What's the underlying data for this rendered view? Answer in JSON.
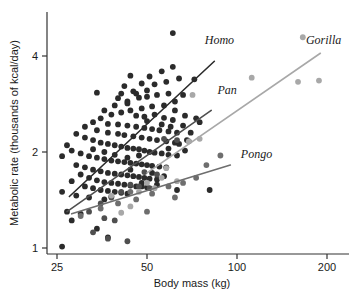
{
  "chart_data": {
    "type": "scatter",
    "title": "",
    "xlabel": "Body mass (kg)",
    "ylabel": "Metabolic rate (thousands of kcal/day)",
    "xscale": "log",
    "yscale": "log",
    "xlim": [
      23,
      215
    ],
    "ylim": [
      0.95,
      5.0
    ],
    "xticks": [
      25,
      50,
      100,
      200
    ],
    "xticklabels": [
      "25",
      "50",
      "100",
      "200"
    ],
    "yticks": [
      1,
      2,
      4
    ],
    "yticklabels": [
      "1",
      "2",
      "4"
    ],
    "grid": false,
    "legend": "none",
    "annotations": [
      {
        "text": "Homo",
        "x": 78,
        "y": 4.35
      },
      {
        "text": "Pan",
        "x": 86,
        "y": 3.05
      },
      {
        "text": "Pongo",
        "x": 103,
        "y": 1.92
      },
      {
        "text": "Gorilla",
        "x": 170,
        "y": 4.35
      }
    ],
    "colors": {
      "homo": "#2b2b2b",
      "pan": "#4f4f4f",
      "pongo": "#6e6e6e",
      "gorilla": "#a8a8a8",
      "axis": "#333333",
      "text": "#1a1a1a"
    },
    "series": [
      {
        "name": "Homo",
        "color": "#2b2b2b",
        "fit_line": {
          "x": [
            27.5,
            84
          ],
          "y": [
            1.45,
            3.85
          ]
        },
        "points": [
          [
            61,
            4.72
          ],
          [
            34,
            3.07
          ],
          [
            44,
            3.47
          ],
          [
            48,
            3.28
          ],
          [
            51,
            3.45
          ],
          [
            56,
            3.58
          ],
          [
            61,
            3.7
          ],
          [
            42,
            3.22
          ],
          [
            46,
            3.05
          ],
          [
            50,
            3.12
          ],
          [
            53,
            3.26
          ],
          [
            58,
            3.32
          ],
          [
            64,
            3.4
          ],
          [
            40,
            2.95
          ],
          [
            43,
            2.88
          ],
          [
            47,
            2.96
          ],
          [
            50,
            2.98
          ],
          [
            54,
            3.02
          ],
          [
            59,
            3.05
          ],
          [
            66,
            3.02
          ],
          [
            72,
            3.38
          ],
          [
            62,
            2.88
          ],
          [
            57,
            2.8
          ],
          [
            52,
            2.78
          ],
          [
            48,
            2.74
          ],
          [
            44,
            2.7
          ],
          [
            41,
            2.66
          ],
          [
            38,
            2.62
          ],
          [
            36,
            2.7
          ],
          [
            39,
            2.8
          ],
          [
            43,
            2.84
          ],
          [
            46,
            2.6
          ],
          [
            49,
            2.58
          ],
          [
            53,
            2.62
          ],
          [
            57,
            2.56
          ],
          [
            61,
            2.52
          ],
          [
            67,
            2.6
          ],
          [
            73,
            2.55
          ],
          [
            35,
            2.55
          ],
          [
            33,
            2.48
          ],
          [
            37,
            2.45
          ],
          [
            40,
            2.44
          ],
          [
            43,
            2.42
          ],
          [
            46,
            2.4
          ],
          [
            49,
            2.38
          ],
          [
            52,
            2.36
          ],
          [
            55,
            2.34
          ],
          [
            59,
            2.32
          ],
          [
            63,
            2.3
          ],
          [
            31,
            2.4
          ],
          [
            34,
            2.34
          ],
          [
            37,
            2.3
          ],
          [
            40,
            2.28
          ],
          [
            42,
            2.26
          ],
          [
            45,
            2.24
          ],
          [
            48,
            2.22
          ],
          [
            51,
            2.2
          ],
          [
            54,
            2.18
          ],
          [
            58,
            2.16
          ],
          [
            62,
            2.14
          ],
          [
            68,
            2.18
          ],
          [
            29,
            2.28
          ],
          [
            31,
            2.22
          ],
          [
            33,
            2.18
          ],
          [
            35,
            2.14
          ],
          [
            37,
            2.12
          ],
          [
            39,
            2.1
          ],
          [
            41,
            2.08
          ],
          [
            43,
            2.06
          ],
          [
            45,
            2.05
          ],
          [
            47,
            2.04
          ],
          [
            49,
            2.02
          ],
          [
            51,
            2.0
          ],
          [
            53,
            1.99
          ],
          [
            56,
            1.98
          ],
          [
            59,
            1.96
          ],
          [
            63,
            1.95
          ],
          [
            67,
            2.02
          ],
          [
            27,
            2.1
          ],
          [
            28,
            2.02
          ],
          [
            30,
            1.98
          ],
          [
            32,
            1.94
          ],
          [
            34,
            1.92
          ],
          [
            36,
            1.9
          ],
          [
            38,
            1.88
          ],
          [
            40,
            1.87
          ],
          [
            42,
            1.86
          ],
          [
            44,
            1.85
          ],
          [
            46,
            1.84
          ],
          [
            48,
            1.83
          ],
          [
            50,
            1.82
          ],
          [
            52,
            1.81
          ],
          [
            55,
            1.8
          ],
          [
            58,
            1.79
          ],
          [
            26,
            1.94
          ],
          [
            29,
            1.82
          ],
          [
            31,
            1.79
          ],
          [
            33,
            1.76
          ],
          [
            35,
            1.74
          ],
          [
            37,
            1.72
          ],
          [
            39,
            1.71
          ],
          [
            41,
            1.7
          ],
          [
            43,
            1.69
          ],
          [
            45,
            1.68
          ],
          [
            47,
            1.67
          ],
          [
            49,
            1.66
          ],
          [
            51,
            1.65
          ],
          [
            54,
            1.64
          ],
          [
            30,
            1.7
          ],
          [
            32,
            1.66
          ],
          [
            34,
            1.63
          ],
          [
            36,
            1.61
          ],
          [
            38,
            1.6
          ],
          [
            40,
            1.59
          ],
          [
            42,
            1.58
          ],
          [
            44,
            1.57
          ],
          [
            46,
            1.56
          ],
          [
            48,
            1.56
          ],
          [
            50,
            1.55
          ],
          [
            28,
            1.62
          ],
          [
            31,
            1.56
          ],
          [
            33,
            1.54
          ],
          [
            35,
            1.52
          ],
          [
            37,
            1.51
          ],
          [
            39,
            1.5
          ],
          [
            41,
            1.49
          ],
          [
            43,
            1.48
          ],
          [
            26,
            1.5
          ],
          [
            29,
            1.46
          ],
          [
            32,
            1.44
          ],
          [
            36,
            1.42
          ],
          [
            38,
            1.45
          ],
          [
            27,
            1.3
          ],
          [
            28,
            1.22
          ],
          [
            30,
            1.28
          ],
          [
            34,
            1.15
          ],
          [
            37,
            1.08
          ],
          [
            26,
            1.01
          ],
          [
            59,
            2.05
          ],
          [
            64,
            2.12
          ],
          [
            70,
            2.3
          ],
          [
            75,
            2.48
          ],
          [
            66,
            2.42
          ],
          [
            62,
            2.7
          ],
          [
            45,
            3.1
          ],
          [
            41,
            3.05
          ],
          [
            50,
            2.5
          ],
          [
            56,
            2.44
          ],
          [
            60,
            2.4
          ],
          [
            47,
            1.95
          ],
          [
            43,
            1.92
          ],
          [
            39,
            1.96
          ],
          [
            36,
            2.0
          ],
          [
            33,
            2.04
          ],
          [
            44,
            1.76
          ],
          [
            52,
            1.72
          ],
          [
            57,
            1.68
          ],
          [
            48,
            1.6
          ],
          [
            54,
            1.58
          ],
          [
            63,
            1.52
          ],
          [
            81,
            1.52
          ]
        ]
      },
      {
        "name": "Pan",
        "color": "#4f4f4f",
        "fit_line": {
          "x": [
            27,
            82
          ],
          "y": [
            1.3,
            2.7
          ]
        },
        "points": [
          [
            57,
            2.2
          ],
          [
            63,
            2.18
          ],
          [
            69,
            2.16
          ],
          [
            49,
            1.73
          ],
          [
            54,
            1.7
          ],
          [
            44,
            1.58
          ],
          [
            47,
            1.56
          ],
          [
            51,
            1.54
          ],
          [
            41,
            1.5
          ],
          [
            38,
            1.44
          ],
          [
            35,
            1.38
          ],
          [
            32,
            1.3
          ],
          [
            36,
            1.24
          ],
          [
            39,
            1.22
          ],
          [
            33,
            1.12
          ],
          [
            43,
            1.05
          ],
          [
            37,
            1.07
          ]
        ]
      },
      {
        "name": "Pongo",
        "color": "#6e6e6e",
        "fit_line": {
          "x": [
            28,
            95
          ],
          "y": [
            1.28,
            1.82
          ]
        },
        "points": [
          [
            88,
            1.95
          ],
          [
            79,
            1.82
          ],
          [
            73,
            1.66
          ],
          [
            66,
            1.6
          ],
          [
            59,
            1.56
          ],
          [
            52,
            1.48
          ],
          [
            46,
            1.42
          ],
          [
            40,
            1.38
          ],
          [
            35,
            1.33
          ],
          [
            30,
            1.26
          ],
          [
            50,
            1.3
          ],
          [
            62,
            1.44
          ],
          [
            44,
            1.5
          ]
        ]
      },
      {
        "name": "Gorilla",
        "color": "#a8a8a8",
        "fit_line": {
          "x": [
            50,
            190
          ],
          "y": [
            1.72,
            4.08
          ]
        },
        "points": [
          [
            166,
            4.58
          ],
          [
            112,
            3.42
          ],
          [
            160,
            3.32
          ],
          [
            188,
            3.35
          ],
          [
            71,
            3.02
          ],
          [
            69,
            2.16
          ],
          [
            58,
            1.78
          ],
          [
            63,
            1.62
          ],
          [
            53,
            1.54
          ],
          [
            47,
            1.5
          ],
          [
            44,
            1.35
          ],
          [
            41,
            1.29
          ],
          [
            38,
            1.46
          ],
          [
            50,
            1.6
          ],
          [
            56,
            1.66
          ],
          [
            75,
            2.2
          ]
        ]
      }
    ]
  }
}
